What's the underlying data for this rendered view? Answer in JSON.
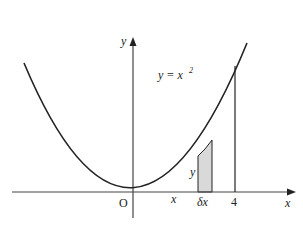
{
  "diagram": {
    "curve_equation": "y = x",
    "curve_exponent": "2",
    "axes": {
      "x_label": "x",
      "y_label": "y",
      "origin_label": "O"
    },
    "strip": {
      "position_label": "x",
      "height_label": "y",
      "width_label": "δx",
      "fill_color": "#d9d9d9"
    },
    "bound": {
      "label": "4"
    },
    "colors": {
      "stroke": "#222222",
      "background": "#ffffff"
    }
  }
}
